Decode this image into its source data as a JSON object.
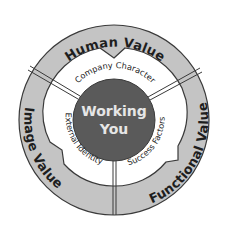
{
  "diagram": {
    "center": {
      "line1": "Working",
      "line2": "You"
    },
    "inner_ring": [
      {
        "label": "Company Character"
      },
      {
        "label": "External Identity"
      },
      {
        "label": "Success Factors"
      }
    ],
    "outer_ring": [
      {
        "label": "Human Value"
      },
      {
        "label": "Image Value"
      },
      {
        "label": "Functional Value"
      }
    ],
    "colors": {
      "outer_ring_fill": "#c4c4c4",
      "inner_ring_fill": "#ffffff",
      "center_fill": "#5a5a5a",
      "outline": "#3a3a3a"
    }
  }
}
